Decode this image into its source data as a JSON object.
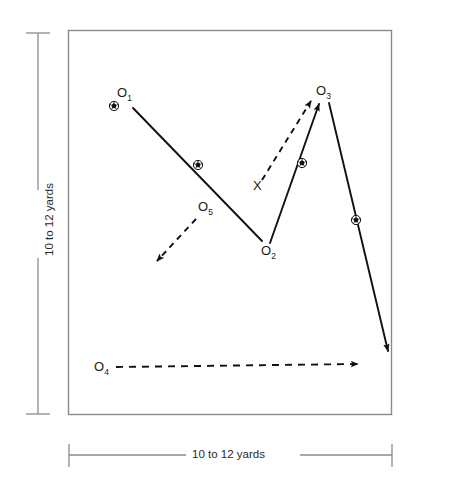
{
  "diagram": {
    "field": {
      "border_color": "#8a8a8a",
      "fill_color": "#ffffff"
    },
    "measurements": {
      "vertical_label": "10 to 12 yards",
      "horizontal_label": "10 to 12 yards",
      "ruler_color": "#8a8a8a"
    },
    "ink_color": "#111111",
    "players": [
      {
        "id": "O1",
        "letter": "O",
        "sub": "1",
        "x": 122,
        "y": 95,
        "has_ball": true
      },
      {
        "id": "O2",
        "letter": "O",
        "sub": "2",
        "x": 266,
        "y": 251,
        "has_ball": false
      },
      {
        "id": "O3",
        "letter": "O",
        "sub": "3",
        "x": 323,
        "y": 92,
        "has_ball": false
      },
      {
        "id": "O4",
        "letter": "O",
        "sub": "4",
        "x": 99,
        "y": 367,
        "has_ball": false
      },
      {
        "id": "O5",
        "letter": "O",
        "sub": "5",
        "x": 203,
        "y": 207,
        "has_ball": false
      },
      {
        "id": "X",
        "letter": "X",
        "sub": "",
        "x": 257,
        "y": 186,
        "has_ball": false
      }
    ],
    "legend_note": "Solid lines = ball path (pass/shot), dashed lines = player run",
    "movements": [
      {
        "name": "pass-o1-to-o2",
        "style": "solid",
        "arrowhead": false,
        "ball_marker": true
      },
      {
        "name": "run-o5-away",
        "style": "dashed",
        "arrowhead": true,
        "ball_marker": false
      },
      {
        "name": "run-x-to-o3",
        "style": "dashed",
        "arrowhead": true,
        "ball_marker": false
      },
      {
        "name": "pass-o2-to-o3",
        "style": "solid",
        "arrowhead": true,
        "ball_marker": true
      },
      {
        "name": "shot-o3-downfield",
        "style": "solid",
        "arrowhead": true,
        "ball_marker": true
      },
      {
        "name": "run-o4-across",
        "style": "dashed",
        "arrowhead": true,
        "ball_marker": false
      }
    ]
  }
}
